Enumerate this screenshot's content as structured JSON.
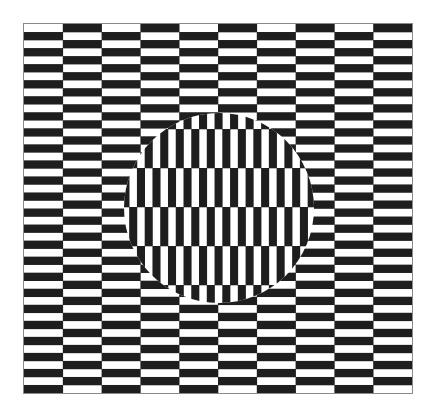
{
  "canvas": {
    "width": 435,
    "height": 411,
    "background": "#ffffff"
  },
  "colors": {
    "dark": "#1e1e1e",
    "light": "#ffffff",
    "border": "#8a8a8a"
  },
  "background_grid": {
    "x": 24,
    "y": 24,
    "width": 388,
    "height": 369,
    "columns": 10,
    "rows": 46,
    "first_cell": "light",
    "orientation": "horizontal-bricks"
  },
  "disc": {
    "cx": 219,
    "cy": 208,
    "r": 95,
    "orientation": "vertical-bricks",
    "cell_width": 7.76,
    "cell_height": 39,
    "x0": 28.3,
    "y0": 12,
    "dark_when_parity": "even"
  }
}
